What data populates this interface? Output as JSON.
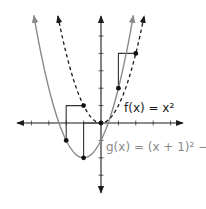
{
  "diagram": {
    "origin_px": [
      101,
      123
    ],
    "unit_px": 17.4,
    "x_ticks": [
      -4,
      -3,
      -2,
      -1,
      1,
      2,
      3,
      4
    ],
    "y_ticks": [
      -3,
      -2,
      -1,
      1,
      2,
      3,
      4,
      5
    ],
    "colors": {
      "f": "#1a1a1a",
      "g": "#8a8a8a",
      "axis": "#1a1a1a",
      "arrow_paths": "#333333"
    },
    "functions": [
      {
        "id": "f",
        "label": "f(x) = x²",
        "style": "dashed",
        "color": "#1a1a1a",
        "expr": "x^2",
        "x_range": [
          -2.48,
          2.48
        ]
      },
      {
        "id": "g",
        "label": "g(x) = (x + 1)² − 2",
        "style": "solid",
        "color": "#8a8a8a",
        "expr": "(x+1)^2-2",
        "x_range": [
          -3.86,
          1.86
        ]
      }
    ],
    "points": [
      {
        "on": "f",
        "x": -1,
        "y": 1
      },
      {
        "on": "f",
        "x": 0,
        "y": 0
      },
      {
        "on": "f",
        "x": 2,
        "y": 4
      },
      {
        "on": "g",
        "x": -2,
        "y": -1
      },
      {
        "on": "g",
        "x": -1,
        "y": -2
      },
      {
        "on": "g",
        "x": 1,
        "y": 2
      }
    ],
    "translation_paths": [
      [
        [
          -1,
          1
        ],
        [
          -2,
          1
        ],
        [
          -2,
          -1
        ]
      ],
      [
        [
          0,
          0
        ],
        [
          -1,
          0
        ],
        [
          -1,
          -2
        ]
      ],
      [
        [
          2,
          4
        ],
        [
          1,
          4
        ],
        [
          1,
          2
        ]
      ]
    ],
    "labels": {
      "f": "f(x) = x²",
      "g": "g(x) = (x + 1)² − 2"
    }
  }
}
